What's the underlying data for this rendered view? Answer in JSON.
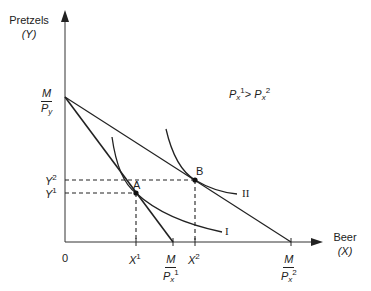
{
  "diagram": {
    "y_axis": {
      "label": "Pretzels",
      "variable": "(Y)"
    },
    "x_axis": {
      "label": "Beer",
      "variable": "(X)"
    },
    "origin_label": "0",
    "condition": {
      "left_p": "P",
      "left_sub": "x",
      "left_sup": "1",
      "op": ">",
      "right_p": "P",
      "right_sub": "x",
      "right_sup": "2"
    },
    "intercepts": {
      "y_intercept": {
        "num": "M",
        "den": "P",
        "den_sub": "y"
      },
      "x_intercept_1": {
        "num": "M",
        "den": "P",
        "den_sub": "x",
        "den_sup": "1"
      },
      "x_intercept_2": {
        "num": "M",
        "den": "P",
        "den_sub": "x",
        "den_sup": "2"
      }
    },
    "points": [
      {
        "name": "A",
        "x_label": "X",
        "x_sup": "1",
        "y_label": "Y",
        "y_sup": "1"
      },
      {
        "name": "B",
        "x_label": "X",
        "x_sup": "2",
        "y_label": "Y",
        "y_sup": "2"
      }
    ],
    "indifference_curves": [
      {
        "label": "I"
      },
      {
        "label": "II"
      }
    ],
    "colors": {
      "ink": "#222222",
      "background": "#ffffff"
    }
  }
}
